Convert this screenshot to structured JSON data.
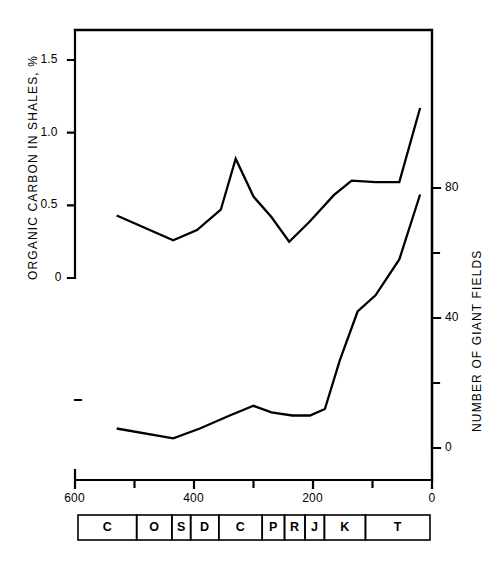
{
  "chart_data": {
    "type": "line",
    "title": "",
    "xlabel": "",
    "x_axis": {
      "label": "",
      "unit": "Ma",
      "ticks": [
        "600",
        "400",
        "200",
        "0"
      ],
      "tick_values": [
        600,
        400,
        200,
        0
      ],
      "minor_tick_values": [
        500,
        300,
        100
      ],
      "range": [
        600,
        0
      ],
      "direction": "reversed"
    },
    "left_axis": {
      "label": "ORGANIC CARBON IN SHALES, %",
      "ticks": [
        "0",
        "0.5",
        "1.0",
        "1.5"
      ],
      "tick_values": [
        0,
        0.5,
        1.0,
        1.5
      ],
      "range": [
        0,
        1.65
      ]
    },
    "right_axis": {
      "label": "NUMBER OF GIANT FIELDS",
      "ticks": [
        "0",
        "40",
        "80"
      ],
      "tick_values": [
        0,
        40,
        80
      ],
      "minor_tick_values": [
        20,
        60
      ],
      "range": [
        0,
        80
      ]
    },
    "grid": false,
    "legend": "none",
    "series": [
      {
        "name": "ORGANIC CARBON IN SHALES, %",
        "axis": "left",
        "x": [
          530,
          435,
          395,
          355,
          330,
          300,
          270,
          240,
          205,
          165,
          135,
          95,
          55,
          20
        ],
        "values": [
          0.43,
          0.26,
          0.33,
          0.47,
          0.82,
          0.56,
          0.42,
          0.25,
          0.39,
          0.57,
          0.67,
          0.66,
          0.66,
          1.17
        ]
      },
      {
        "name": "NUMBER OF GIANT FIELDS",
        "axis": "right",
        "x": [
          530,
          435,
          390,
          340,
          300,
          270,
          235,
          205,
          180,
          155,
          125,
          95,
          55,
          20
        ],
        "values": [
          6,
          3,
          6,
          10,
          13,
          11,
          10,
          10,
          12,
          27,
          42,
          47,
          58,
          78
        ]
      }
    ],
    "period_bar": {
      "label": "geologic periods",
      "cells": [
        {
          "symbol": "C",
          "start": 600,
          "end": 500
        },
        {
          "symbol": "O",
          "start": 500,
          "end": 440
        },
        {
          "symbol": "S",
          "start": 440,
          "end": 408
        },
        {
          "symbol": "D",
          "start": 408,
          "end": 360
        },
        {
          "symbol": "C",
          "start": 360,
          "end": 286
        },
        {
          "symbol": "P",
          "start": 286,
          "end": 248
        },
        {
          "symbol": "R",
          "start": 248,
          "end": 213
        },
        {
          "symbol": "J",
          "start": 213,
          "end": 180
        },
        {
          "symbol": "K",
          "start": 180,
          "end": 110
        },
        {
          "symbol": "T",
          "start": 110,
          "end": 0
        }
      ]
    }
  },
  "style": {
    "line_color": "#000000",
    "axis_color": "#000000",
    "background": "#ffffff"
  }
}
